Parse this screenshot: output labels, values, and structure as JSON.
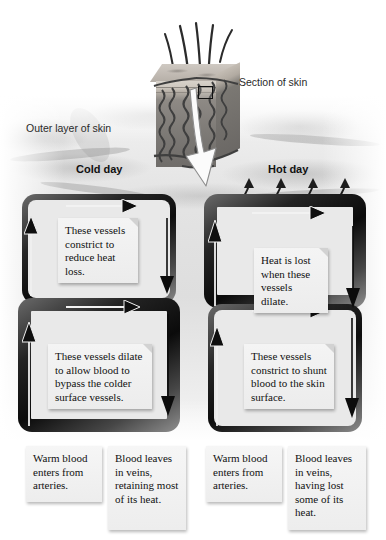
{
  "figure": {
    "labels": {
      "section_of_skin": "Section of skin",
      "outer_layer_of_skin": "Outer layer of skin"
    },
    "colors": {
      "background": "#ffffff",
      "skin_texture": "#e4e4e4",
      "vessel_dark": "#161616",
      "note_box": "#efefef",
      "text": "#111111",
      "heat_arrow": "#1a1a1a"
    }
  },
  "panels": [
    {
      "id": "cold-day",
      "heading": "Cold day",
      "heat_arrows_count": 0,
      "surface_vessel": {
        "state": "constricted",
        "thickness": "thin",
        "note": "These vessels constrict to reduce heat loss."
      },
      "deep_vessel": {
        "state": "dilated",
        "thickness": "thick",
        "note": "These vessels dilate to allow blood to bypass the colder surface vessels."
      },
      "captions": [
        "Warm blood enters from arteries.",
        "Blood leaves in veins, retaining most of its heat."
      ]
    },
    {
      "id": "hot-day",
      "heading": "Hot day",
      "heat_arrows_count": 4,
      "surface_vessel": {
        "state": "dilated",
        "thickness": "thick",
        "note": "Heat is lost when these vessels dilate."
      },
      "deep_vessel": {
        "state": "constricted",
        "thickness": "thin",
        "note": "These vessels constrict to shunt blood to the skin surface."
      },
      "captions": [
        "Warm blood enters from arteries.",
        "Blood leaves in veins, having lost some of its heat."
      ]
    }
  ],
  "skin_block": {
    "hair_count": 5,
    "highlight_square": true,
    "callout_arrow": "white-curved-arrow-down"
  }
}
